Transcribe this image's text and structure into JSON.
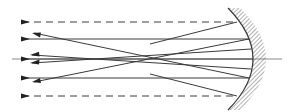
{
  "diagram": {
    "type": "optics-ray-diagram",
    "colors": {
      "ray": "#3a3a3a",
      "axis": "#8a8a8a",
      "hatch": "#555555",
      "background": "#ffffff"
    },
    "optical_axis": {
      "x1": 12,
      "y1": 59,
      "x2": 282,
      "y2": 59
    },
    "mirror": {
      "kind": "concave-spherical",
      "top": {
        "x": 228,
        "y": 8
      },
      "vertex": {
        "x": 253,
        "y": 59
      },
      "bottom": {
        "x": 228,
        "y": 110
      },
      "hatch_side": "right"
    },
    "incident_rays": [
      {
        "id": "marginal-top",
        "style": "dashed",
        "y": 22,
        "x_start": 22,
        "x_end": 237
      },
      {
        "id": "zonal-top",
        "style": "solid",
        "y": 39,
        "x_start": 22,
        "x_end": 249
      },
      {
        "id": "axial",
        "style": "solid",
        "y": 59,
        "x_start": 22,
        "x_end": 253
      },
      {
        "id": "zonal-bottom",
        "style": "solid",
        "y": 78,
        "x_start": 22,
        "x_end": 249
      },
      {
        "id": "marginal-bottom",
        "style": "dashed",
        "y": 96,
        "x_start": 22,
        "x_end": 237
      }
    ],
    "reflected_rays": [
      {
        "id": "reflected-from-top-zone",
        "from": {
          "x": 249,
          "y": 39
        },
        "to": {
          "x": 34,
          "y": 82
        }
      },
      {
        "id": "reflected-from-bottom-zone",
        "from": {
          "x": 249,
          "y": 78
        },
        "to": {
          "x": 34,
          "y": 33
        }
      },
      {
        "id": "reflected-near-axis-upper",
        "from": {
          "x": 251,
          "y": 49
        },
        "to": {
          "x": 32,
          "y": 63
        }
      },
      {
        "id": "reflected-near-axis-lower",
        "from": {
          "x": 251,
          "y": 69
        },
        "to": {
          "x": 32,
          "y": 55
        }
      }
    ]
  }
}
